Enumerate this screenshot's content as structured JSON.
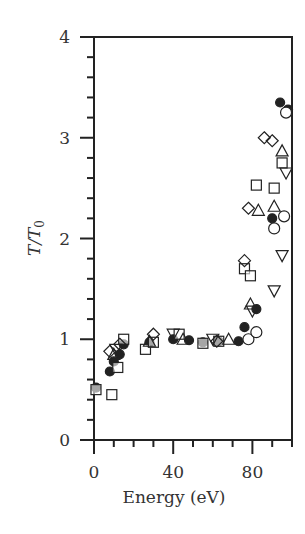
{
  "chart_data": {
    "type": "scatter",
    "title": "",
    "xlabel": "Energy (eV)",
    "ylabel": "T/T0",
    "ylabel_parts": {
      "main": "T/T",
      "sub": "0"
    },
    "xlim": [
      0,
      100
    ],
    "ylim": [
      0,
      4
    ],
    "x_ticks": [
      0,
      40,
      80
    ],
    "x_minor_ticks": [
      10,
      20,
      30,
      50,
      60,
      70,
      90,
      100
    ],
    "y_ticks": [
      0,
      1,
      2,
      3,
      4
    ],
    "y_minor_step": 0.2,
    "grid": false,
    "legend": null,
    "series": [
      {
        "name": "filled-circle",
        "marker": "circle-filled",
        "points": [
          [
            1,
            0.52
          ],
          [
            8,
            0.68
          ],
          [
            10,
            0.78
          ],
          [
            13,
            0.85
          ],
          [
            15,
            0.95
          ],
          [
            28,
            0.97
          ],
          [
            40,
            1.0
          ],
          [
            48,
            0.99
          ],
          [
            55,
            0.97
          ],
          [
            63,
            0.98
          ],
          [
            73,
            0.98
          ],
          [
            76,
            1.12
          ],
          [
            78,
            1.0
          ],
          [
            82,
            1.3
          ],
          [
            90,
            2.2
          ],
          [
            94,
            3.35
          ],
          [
            98,
            3.28
          ]
        ]
      },
      {
        "name": "open-circle",
        "marker": "circle-open",
        "points": [
          [
            78,
            1.0
          ],
          [
            82,
            1.07
          ],
          [
            91,
            2.1
          ],
          [
            96,
            2.22
          ],
          [
            97,
            3.25
          ]
        ]
      },
      {
        "name": "open-square",
        "marker": "square-open",
        "points": [
          [
            1,
            0.5
          ],
          [
            9,
            0.45
          ],
          [
            12,
            0.72
          ],
          [
            15,
            1.0
          ],
          [
            26,
            0.9
          ],
          [
            30,
            0.97
          ],
          [
            43,
            1.05
          ],
          [
            55,
            0.96
          ],
          [
            63,
            0.98
          ],
          [
            76,
            1.7
          ],
          [
            79,
            1.63
          ],
          [
            82,
            2.53
          ],
          [
            91,
            2.5
          ],
          [
            95,
            2.75
          ]
        ]
      },
      {
        "name": "open-diamond",
        "marker": "diamond-open",
        "points": [
          [
            8,
            0.88
          ],
          [
            13,
            0.95
          ],
          [
            30,
            1.05
          ],
          [
            62,
            0.98
          ],
          [
            76,
            1.78
          ],
          [
            78,
            2.3
          ],
          [
            86,
            3.0
          ],
          [
            90,
            2.97
          ]
        ]
      },
      {
        "name": "open-triangle-up",
        "marker": "triangle-up-open",
        "points": [
          [
            10,
            0.85
          ],
          [
            28,
            0.98
          ],
          [
            45,
            1.0
          ],
          [
            68,
            1.0
          ],
          [
            79,
            1.35
          ],
          [
            83,
            2.28
          ],
          [
            91,
            2.32
          ],
          [
            95,
            2.87
          ]
        ]
      },
      {
        "name": "open-triangle-down",
        "marker": "triangle-down-open",
        "points": [
          [
            11,
            0.9
          ],
          [
            40,
            1.05
          ],
          [
            60,
            1.0
          ],
          [
            80,
            1.28
          ],
          [
            91,
            1.48
          ],
          [
            95,
            1.83
          ],
          [
            97,
            2.65
          ]
        ]
      }
    ]
  },
  "colors": {
    "axis": "#222222",
    "marker": "#222222",
    "text": "#333333"
  }
}
